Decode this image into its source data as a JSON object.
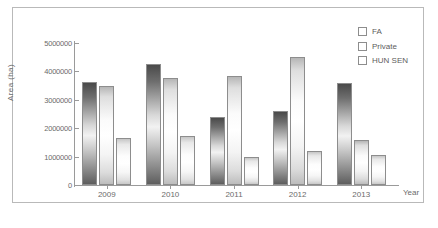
{
  "chart_data": {
    "type": "bar",
    "title": "",
    "xlabel": "Year",
    "ylabel": "Area (ha)",
    "categories": [
      "2009",
      "2010",
      "2011",
      "2012",
      "2013"
    ],
    "ylim": [
      0,
      5000000
    ],
    "ytick_labels": [
      "0",
      "1000000",
      "2000000",
      "3000000",
      "4000000",
      "5000000"
    ],
    "ytick_values": [
      0,
      1000000,
      2000000,
      3000000,
      4000000,
      5000000
    ],
    "grid": false,
    "legend_position": "top-right",
    "series": [
      {
        "name": "FA",
        "values": [
          3630000,
          4250000,
          2400000,
          2600000,
          3600000
        ]
      },
      {
        "name": "Private",
        "values": [
          3480000,
          3780000,
          3850000,
          4490000,
          1600000
        ]
      },
      {
        "name": "HUN SEN",
        "values": [
          1650000,
          1740000,
          990000,
          1210000,
          1040000
        ]
      }
    ]
  },
  "legend": {
    "items": [
      {
        "label": "FA"
      },
      {
        "label": "Private"
      },
      {
        "label": "HUN SEN"
      }
    ]
  },
  "caption": {
    "text": ""
  }
}
